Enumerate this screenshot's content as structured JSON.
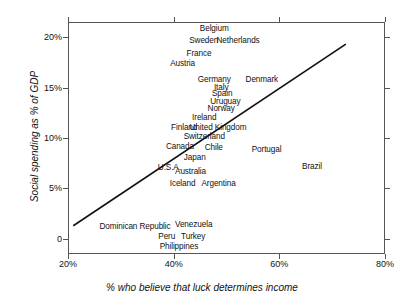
{
  "chart_data": {
    "type": "scatter",
    "title": "",
    "xlabel": "% who believe that luck determines income",
    "ylabel": "Social spending as % of GDP",
    "xlim": [
      20,
      80
    ],
    "ylim": [
      -1.5,
      21.5
    ],
    "xticks": [
      {
        "value": 20,
        "label": "20%"
      },
      {
        "value": 40,
        "label": "40%"
      },
      {
        "value": 60,
        "label": "60%"
      },
      {
        "value": 80,
        "label": "80%"
      }
    ],
    "yticks": [
      {
        "value": 0,
        "label": "0"
      },
      {
        "value": 5,
        "label": "5%"
      },
      {
        "value": 10,
        "label": "10%"
      },
      {
        "value": 15,
        "label": "15%"
      },
      {
        "value": 20,
        "label": "20%"
      }
    ],
    "grid": false,
    "legend": null,
    "point_marker": "text-label-only",
    "trendline": {
      "type": "linear",
      "x0": 20.8,
      "y0": 1.4,
      "x1": 72.4,
      "y1": 19.4,
      "color": "#111111"
    },
    "points": [
      {
        "label": "Belgium",
        "x": 47.5,
        "y": 21.0
      },
      {
        "label": "Sweden",
        "x": 45.5,
        "y": 19.8
      },
      {
        "label": "Netherlands",
        "x": 52.0,
        "y": 19.8
      },
      {
        "label": "France",
        "x": 44.6,
        "y": 18.5
      },
      {
        "label": "Austria",
        "x": 41.5,
        "y": 17.5
      },
      {
        "label": "Germany",
        "x": 47.5,
        "y": 15.9
      },
      {
        "label": "Denmark",
        "x": 56.5,
        "y": 15.9
      },
      {
        "label": "Italy",
        "x": 48.8,
        "y": 15.2
      },
      {
        "label": "Spain",
        "x": 49.0,
        "y": 14.6
      },
      {
        "label": "Uruguay",
        "x": 49.6,
        "y": 13.8
      },
      {
        "label": "Norway",
        "x": 48.8,
        "y": 13.1
      },
      {
        "label": "Ireland",
        "x": 45.6,
        "y": 12.2
      },
      {
        "label": "Finland",
        "x": 41.8,
        "y": 11.2
      },
      {
        "label": "United Kingdom",
        "x": 48.2,
        "y": 11.2
      },
      {
        "label": "Switzerland",
        "x": 45.6,
        "y": 10.3
      },
      {
        "label": "Canada",
        "x": 41.0,
        "y": 9.3
      },
      {
        "label": "Chile",
        "x": 47.4,
        "y": 9.2
      },
      {
        "label": "Portugal",
        "x": 57.4,
        "y": 9.0
      },
      {
        "label": "Japan",
        "x": 43.8,
        "y": 8.2
      },
      {
        "label": "U.S.A.",
        "x": 39.0,
        "y": 7.2
      },
      {
        "label": "Brazil",
        "x": 66.0,
        "y": 7.3
      },
      {
        "label": "Australia",
        "x": 43.0,
        "y": 6.8
      },
      {
        "label": "Iceland",
        "x": 41.5,
        "y": 5.6
      },
      {
        "label": "Argentina",
        "x": 48.3,
        "y": 5.6
      },
      {
        "label": "Dominican Republic",
        "x": 32.5,
        "y": 1.4
      },
      {
        "label": "Venezuela",
        "x": 43.6,
        "y": 1.6
      },
      {
        "label": "Peru",
        "x": 38.5,
        "y": 0.4
      },
      {
        "label": "Turkey",
        "x": 43.5,
        "y": 0.4
      },
      {
        "label": "Philippines",
        "x": 40.8,
        "y": -0.6
      }
    ]
  }
}
